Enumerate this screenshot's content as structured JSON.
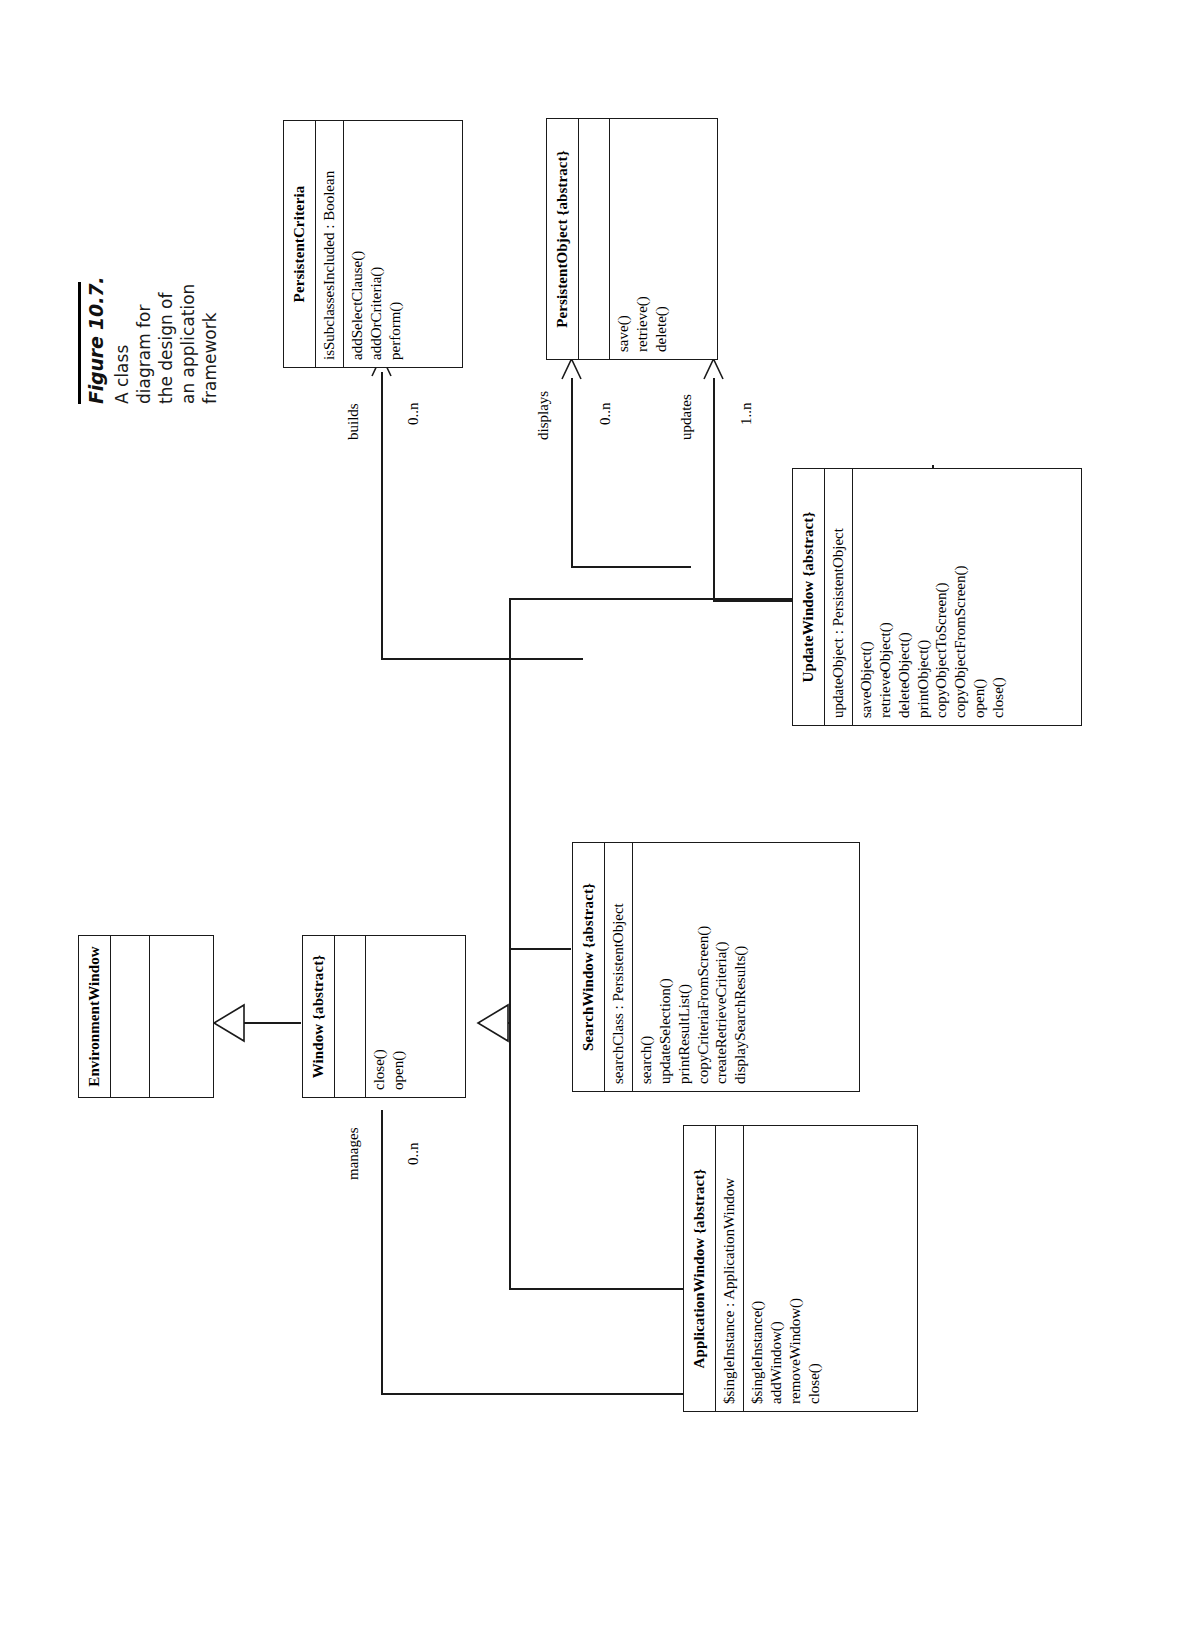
{
  "figure": {
    "number": "Figure 10.7.",
    "caption": "A class diagram for the design of an application framework"
  },
  "diagram": {
    "type": "uml-class-diagram",
    "orientation": "rotated-90-ccw",
    "classes": [
      {
        "id": "persistent-criteria",
        "name": "PersistentCriteria",
        "stereotype": "",
        "attributes": [
          "isSubclassesIncluded : Boolean"
        ],
        "operations": [
          "addSelectClause()",
          "addOrCriteria()",
          "perform()"
        ]
      },
      {
        "id": "persistent-object",
        "name": "PersistentObject {abstract}",
        "attributes": [],
        "operations": [
          "save()",
          "retrieve()",
          "delete()"
        ]
      },
      {
        "id": "update-window",
        "name": "UpdateWindow {abstract}",
        "attributes": [
          "updateObject : PersistentObject"
        ],
        "operations": [
          "saveObject()",
          "retrieveObject()",
          "deleteObject()",
          "printObject()",
          "copyObjectToScreen()",
          "copyObjectFromScreen()",
          "open()",
          "close()"
        ]
      },
      {
        "id": "search-window",
        "name": "SearchWindow {abstract}",
        "attributes": [
          "searchClass : PersistentObject"
        ],
        "operations": [
          "search()",
          "updateSelection()",
          "printResultList()",
          "copyCriteriaFromScreen()",
          "createRetrieveCriteria()",
          "displaySearchResults()"
        ]
      },
      {
        "id": "application-window",
        "name": "ApplicationWindow {abstract}",
        "attributes": [
          "$singleInstance : ApplicationWindow"
        ],
        "operations": [
          "$singleInstance()",
          "addWindow()",
          "removeWindow()",
          "close()"
        ]
      },
      {
        "id": "window",
        "name": "Window {abstract}",
        "attributes": [],
        "operations": [
          "close()",
          "open()"
        ]
      },
      {
        "id": "environment-window",
        "name": "EnvironmentWindow",
        "attributes": [],
        "operations": []
      }
    ],
    "associations": [
      {
        "id": "builds",
        "label": "builds",
        "source": "search-window",
        "target": "persistent-criteria",
        "target_multiplicity": "0..n"
      },
      {
        "id": "displays",
        "label": "displays",
        "source": "search-window",
        "target": "persistent-object",
        "target_multiplicity": "0..n"
      },
      {
        "id": "updates",
        "label": "updates",
        "source": "update-window",
        "target": "persistent-object",
        "target_multiplicity": "1..n"
      },
      {
        "id": "manages",
        "label": "manages",
        "source": "application-window",
        "target": "window",
        "target_multiplicity": "0..n"
      }
    ],
    "generalizations": [
      {
        "id": "gen-window-env",
        "subclass": "Window {abstract}",
        "superclass": "EnvironmentWindow"
      },
      {
        "id": "gen-search-window",
        "subclass": "SearchWindow {abstract}",
        "superclass": "Window {abstract}"
      },
      {
        "id": "gen-update-window",
        "subclass": "UpdateWindow {abstract}",
        "superclass": "Window {abstract}"
      },
      {
        "id": "gen-app-window",
        "subclass": "ApplicationWindow {abstract}",
        "superclass": "Window {abstract}"
      }
    ]
  }
}
